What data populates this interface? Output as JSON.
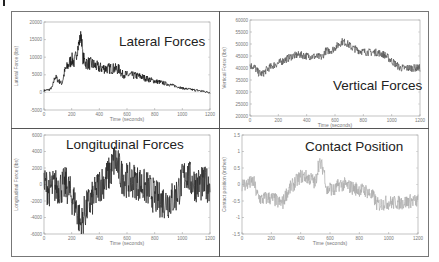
{
  "figure": {
    "panels": [
      {
        "id": "lateral",
        "title": "Lateral Forces"
      },
      {
        "id": "vertical",
        "title": "Vertical Forces"
      },
      {
        "id": "longitudinal",
        "title": "Longitudinal Forces"
      },
      {
        "id": "contact",
        "title": "Contact Position"
      }
    ]
  },
  "chart_data": [
    {
      "type": "line",
      "title": "Lateral Forces",
      "xlabel": "Time (seconds)",
      "ylabel": "Lateral Force (lbs)",
      "xlim": [
        0,
        1200
      ],
      "ylim": [
        -5000,
        20000
      ],
      "xticks": [
        0,
        200,
        400,
        600,
        800,
        1000,
        1200
      ],
      "yticks": [
        20000,
        15000,
        10000,
        5000,
        0,
        -5000
      ],
      "grid": false,
      "line_color": "#111111",
      "noise": 1400,
      "series": [
        {
          "name": "Lateral Force",
          "x": [
            0,
            40,
            60,
            80,
            100,
            130,
            150,
            180,
            200,
            220,
            240,
            260,
            270,
            280,
            300,
            350,
            400,
            450,
            500,
            550,
            560,
            600,
            650,
            700,
            750,
            800,
            850,
            900,
            950,
            1000,
            1050,
            1100,
            1150,
            1200
          ],
          "y": [
            500,
            800,
            1500,
            4500,
            3500,
            2500,
            6000,
            8000,
            9500,
            8500,
            12000,
            15000,
            16500,
            10000,
            8500,
            8000,
            7000,
            6800,
            6800,
            6500,
            5200,
            5000,
            4800,
            4500,
            3800,
            3200,
            2800,
            2300,
            1800,
            1200,
            900,
            600,
            300,
            0
          ]
        }
      ]
    },
    {
      "type": "line",
      "title": "Vertical Forces",
      "xlabel": "Time (seconds)",
      "ylabel": "Vertical Force (lbs)",
      "xlim": [
        0,
        1200
      ],
      "ylim": [
        20000,
        60000
      ],
      "xticks": [
        0,
        200,
        400,
        600,
        800,
        1000,
        1200
      ],
      "yticks": [
        60000,
        55000,
        50000,
        45000,
        40000,
        35000,
        30000,
        25000,
        20000
      ],
      "grid": false,
      "line_color": "#555555",
      "noise": 1600,
      "series": [
        {
          "name": "Vertical Force",
          "x": [
            0,
            30,
            60,
            90,
            120,
            160,
            200,
            250,
            300,
            350,
            400,
            450,
            510,
            530,
            580,
            620,
            650,
            680,
            720,
            760,
            800,
            850,
            900,
            950,
            980,
            1020,
            1060,
            1100,
            1150,
            1200
          ],
          "y": [
            41000,
            40500,
            38000,
            37500,
            39500,
            41000,
            42000,
            43500,
            45000,
            45500,
            45000,
            44800,
            44500,
            47000,
            47500,
            49500,
            51000,
            50500,
            48500,
            47500,
            46800,
            46500,
            46500,
            45500,
            44000,
            42000,
            40000,
            40000,
            40000,
            40000
          ]
        }
      ]
    },
    {
      "type": "line",
      "title": "Longitudinal Forces",
      "xlabel": "Time (seconds)",
      "ylabel": "Longitudinal Force (lbs)",
      "xlim": [
        0,
        1200
      ],
      "ylim": [
        -6000,
        6000
      ],
      "xticks": [
        0,
        200,
        400,
        600,
        800,
        1000,
        1200
      ],
      "yticks": [
        6000,
        4000,
        2000,
        0,
        -2000,
        -4000,
        -6000
      ],
      "grid": false,
      "line_color": "#222222",
      "noise": 2200,
      "series": [
        {
          "name": "Longitudinal Force",
          "x": [
            0,
            40,
            80,
            120,
            160,
            200,
            230,
            260,
            270,
            290,
            320,
            360,
            400,
            440,
            480,
            510,
            530,
            560,
            600,
            650,
            700,
            750,
            800,
            850,
            900,
            950,
            1000,
            1030,
            1060,
            1100,
            1150,
            1200
          ],
          "y": [
            0,
            -500,
            -200,
            -300,
            0,
            -1500,
            -2500,
            -4500,
            -5000,
            -3500,
            -2500,
            -1500,
            0,
            500,
            1500,
            3000,
            2500,
            1000,
            500,
            500,
            0,
            -500,
            -1500,
            -2000,
            -2000,
            -1500,
            500,
            1500,
            500,
            0,
            0,
            0
          ]
        }
      ]
    },
    {
      "type": "line",
      "title": "Contact Position",
      "xlabel": "Time (seconds)",
      "ylabel": "Contact position (inches)",
      "xlim": [
        0,
        1200
      ],
      "ylim": [
        -1.5,
        1.5
      ],
      "xticks": [
        0,
        200,
        400,
        600,
        800,
        1000,
        1200
      ],
      "yticks": [
        1.5,
        1,
        0.5,
        0,
        -0.5,
        -1,
        -1.5
      ],
      "grid": false,
      "line_color": "#aaaaaa",
      "noise": 0.22,
      "series": [
        {
          "name": "Contact Position",
          "x": [
            0,
            30,
            60,
            80,
            100,
            130,
            180,
            220,
            250,
            280,
            300,
            330,
            370,
            400,
            430,
            450,
            480,
            500,
            520,
            540,
            560,
            580,
            600,
            630,
            660,
            700,
            750,
            800,
            850,
            900,
            920,
            950,
            980,
            1000,
            1050,
            1100,
            1150,
            1200
          ],
          "y": [
            0,
            0,
            0.05,
            0.1,
            -0.3,
            -0.45,
            -0.4,
            -0.45,
            -0.55,
            -0.55,
            -0.3,
            -0.1,
            0.1,
            0.25,
            0.25,
            0.2,
            0.15,
            0.0,
            0.6,
            0.6,
            0.4,
            -0.2,
            -0.1,
            -0.2,
            0.0,
            0.0,
            -0.1,
            -0.15,
            -0.2,
            -0.4,
            -0.6,
            -0.6,
            -0.55,
            -0.55,
            -0.55,
            -0.55,
            -0.5,
            -0.5
          ]
        }
      ]
    }
  ]
}
